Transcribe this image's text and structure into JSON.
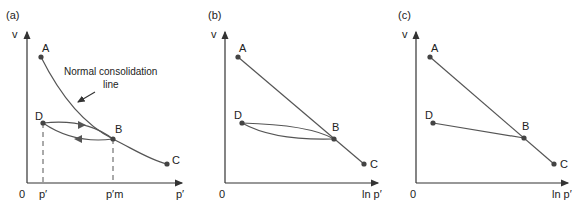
{
  "panels": [
    {
      "id": "a",
      "tag": "(a)",
      "y_axis_label": "v",
      "x_axis_label": "p′",
      "origin_label": "0",
      "x_ticks": [
        "p′",
        "p′m"
      ],
      "points": {
        "A": "A",
        "B": "B",
        "C": "C",
        "D": "D"
      },
      "annotation_line1": "Normal consolidation",
      "annotation_line2": "line"
    },
    {
      "id": "b",
      "tag": "(b)",
      "y_axis_label": "v",
      "x_axis_label": "ln p′",
      "origin_label": "0",
      "points": {
        "A": "A",
        "B": "B",
        "C": "C",
        "D": "D"
      }
    },
    {
      "id": "c",
      "tag": "(c)",
      "y_axis_label": "v",
      "x_axis_label": "ln p′",
      "origin_label": "0",
      "points": {
        "A": "A",
        "B": "B",
        "C": "C",
        "D": "D"
      }
    }
  ],
  "colors": {
    "line": "#555555",
    "point": "#444444",
    "text": "#222222"
  }
}
